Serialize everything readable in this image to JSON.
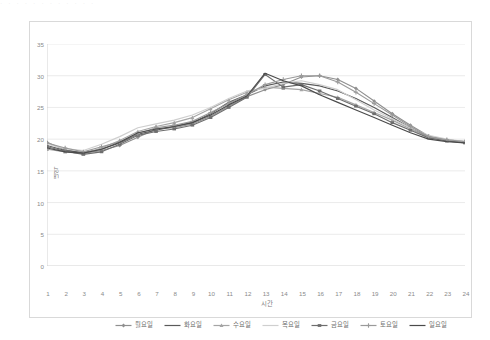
{
  "page": {
    "top_faint_text": "· · ·  · · ·   ·  · ·   · · ·"
  },
  "axis": {
    "y_title": "내역",
    "x_title": "시간",
    "y_ticks": [
      "0",
      "5",
      "10",
      "15",
      "20",
      "25",
      "30",
      "35"
    ],
    "x_ticks": [
      "1",
      "2",
      "3",
      "4",
      "5",
      "6",
      "7",
      "8",
      "9",
      "10",
      "11",
      "12",
      "13",
      "14",
      "15",
      "16",
      "17",
      "18",
      "19",
      "20",
      "21",
      "22",
      "23",
      "24"
    ]
  },
  "legend": {
    "items": [
      {
        "label": "월요일",
        "color": "#8f8f8f",
        "marker": "diamond"
      },
      {
        "label": "화요일",
        "color": "#5a5a5a",
        "marker": "none"
      },
      {
        "label": "수요일",
        "color": "#a5a5a5",
        "marker": "triangle"
      },
      {
        "label": "목요일",
        "color": "#cfcfcf",
        "marker": "none"
      },
      {
        "label": "금요일",
        "color": "#6e6e6e",
        "marker": "bar"
      },
      {
        "label": "토요일",
        "color": "#9a9a9a",
        "marker": "plus"
      },
      {
        "label": "일요일",
        "color": "#4a4a4a",
        "marker": "none"
      }
    ]
  },
  "chart_data": {
    "type": "line",
    "title": "",
    "xlabel": "시간",
    "ylabel": "내역",
    "xlim": [
      1,
      24
    ],
    "ylim": [
      0,
      35
    ],
    "y_tick_step": 5,
    "grid": "horizontal",
    "legend_position": "bottom",
    "x": [
      1,
      2,
      3,
      4,
      5,
      6,
      7,
      8,
      9,
      10,
      11,
      12,
      13,
      14,
      15,
      16,
      17,
      18,
      19,
      20,
      21,
      22,
      23,
      24
    ],
    "series": [
      {
        "name": "월요일",
        "color": "#8f8f8f",
        "values": [
          19.5,
          18.3,
          17.8,
          18.2,
          19.0,
          20.3,
          21.6,
          21.8,
          22.4,
          23.6,
          25.2,
          26.7,
          27.8,
          28.6,
          29.8,
          30.0,
          29.4,
          28.0,
          26.0,
          24.0,
          22.2,
          20.5,
          19.9,
          19.6
        ]
      },
      {
        "name": "화요일",
        "color": "#5a5a5a",
        "values": [
          19.0,
          18.2,
          17.9,
          18.4,
          19.4,
          20.8,
          21.4,
          22.0,
          22.6,
          24.0,
          25.8,
          27.0,
          28.4,
          29.0,
          28.8,
          28.4,
          27.6,
          26.4,
          25.0,
          23.4,
          21.8,
          20.4,
          19.8,
          19.5
        ]
      },
      {
        "name": "수요일",
        "color": "#a5a5a5",
        "values": [
          18.4,
          18.0,
          17.7,
          18.6,
          19.8,
          21.2,
          22.0,
          22.6,
          23.4,
          24.8,
          26.2,
          27.4,
          28.2,
          28.0,
          27.8,
          27.2,
          26.6,
          25.4,
          24.2,
          23.0,
          21.6,
          20.3,
          19.8,
          19.5
        ]
      },
      {
        "name": "목요일",
        "color": "#cfcfcf",
        "values": [
          19.2,
          18.5,
          18.2,
          19.2,
          20.4,
          21.8,
          22.4,
          23.0,
          23.8,
          25.0,
          26.4,
          27.6,
          28.0,
          28.8,
          29.2,
          28.6,
          27.8,
          26.2,
          24.6,
          23.2,
          21.8,
          20.6,
          20.0,
          19.6
        ]
      },
      {
        "name": "금요일",
        "color": "#6e6e6e",
        "values": [
          18.8,
          18.1,
          17.6,
          18.0,
          19.2,
          20.6,
          21.2,
          21.6,
          22.2,
          23.4,
          25.0,
          26.6,
          30.2,
          28.2,
          28.6,
          27.6,
          26.4,
          25.2,
          24.0,
          22.6,
          21.4,
          20.2,
          19.7,
          19.4
        ]
      },
      {
        "name": "토요일",
        "color": "#9a9a9a",
        "values": [
          19.4,
          18.6,
          18.0,
          18.8,
          19.6,
          20.9,
          21.8,
          22.2,
          22.8,
          24.2,
          25.6,
          27.0,
          28.6,
          29.4,
          30.0,
          30.0,
          29.0,
          27.4,
          25.6,
          23.8,
          22.0,
          20.4,
          19.9,
          19.6
        ]
      },
      {
        "name": "일요일",
        "color": "#4a4a4a",
        "values": [
          18.6,
          18.0,
          17.8,
          18.4,
          19.5,
          21.0,
          21.6,
          22.0,
          22.6,
          23.8,
          25.4,
          26.8,
          30.4,
          29.2,
          28.4,
          27.0,
          25.8,
          24.6,
          23.4,
          22.2,
          21.0,
          20.0,
          19.6,
          19.4
        ]
      }
    ]
  }
}
